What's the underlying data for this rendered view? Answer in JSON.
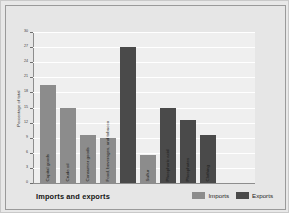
{
  "chart_data": {
    "type": "bar",
    "title": "Imports and exports",
    "xlabel": "",
    "ylabel": "Percentage of total",
    "ylim": [
      0,
      30
    ],
    "yticks": [
      0,
      3,
      6,
      9,
      12,
      15,
      18,
      21,
      24,
      27,
      30
    ],
    "grid": true,
    "legend_position": "bottom-right",
    "legend": [
      "Imports",
      "Exports"
    ],
    "categories": [
      "Capital goods",
      "Crude oil",
      "Consumer goods",
      "Food, beverages, and tobacco",
      "Sulfur",
      "Phosphoric acid",
      "Phosphates",
      "Clothing"
    ],
    "bars": [
      {
        "label": "Capital goods",
        "series": "Imports",
        "value": 19.5
      },
      {
        "label": "Crude oil",
        "series": "Imports",
        "value": 15
      },
      {
        "label": "Consumer goods",
        "series": "Imports",
        "value": 9.5
      },
      {
        "label": "Food, beverages, and tobacco",
        "series": "Imports",
        "value": 9
      },
      {
        "label": "",
        "series": "Exports",
        "value": 27
      },
      {
        "label": "Sulfur",
        "series": "Imports",
        "value": 5.5
      },
      {
        "label": "Phosphoric acid",
        "series": "Exports",
        "value": 15
      },
      {
        "label": "Phosphates",
        "series": "Exports",
        "value": 12.5
      },
      {
        "label": "Clothing",
        "series": "Exports",
        "value": 9.5
      }
    ],
    "series": [
      {
        "name": "Imports",
        "color": "#8c8c8c",
        "values": [
          19.5,
          15,
          9.5,
          9,
          5.5,
          null,
          null,
          null
        ]
      },
      {
        "name": "Exports",
        "color": "#4a4a4a",
        "values": [
          null,
          null,
          null,
          27,
          null,
          15,
          12.5,
          9.5
        ]
      }
    ]
  },
  "colors": {
    "imports": "#8c8c8c",
    "exports": "#4a4a4a",
    "plot_background": "#efefef",
    "figure_background": "#e6e6e6",
    "gridline": "#ffffff",
    "axis": "#8d8d8d"
  }
}
